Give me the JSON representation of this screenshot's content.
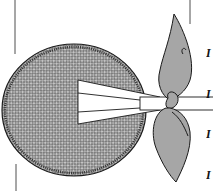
{
  "illustration": {
    "subject": "round woven fan with split-stick handle tied by ribbon bow",
    "colors": {
      "background": "#ffffff",
      "outline": "#1a1a1a",
      "weave_fill": "#8a8a8a",
      "weave_light": "#c8c8c8",
      "ribbon_fill": "#a6a6a6",
      "handle_fill": "#ffffff"
    }
  },
  "edge_text": {
    "lines": [
      "I",
      "I",
      "I",
      "I"
    ]
  }
}
